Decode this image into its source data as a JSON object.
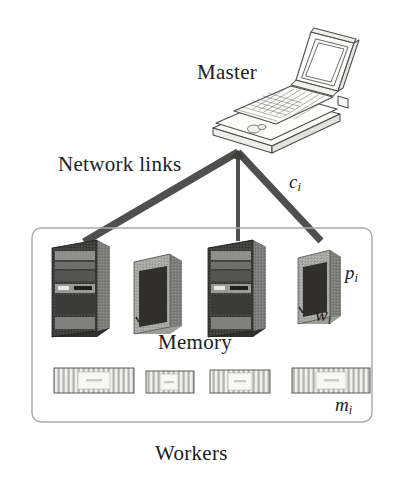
{
  "figure": {
    "width": 404,
    "height": 477,
    "background": "#ffffff"
  },
  "labels": {
    "master": "Master",
    "network_links": "Network links",
    "memory": "Memory",
    "workers": "Workers",
    "link_capacity_symbol": "c",
    "link_capacity_subscript": "i",
    "processor_symbol": "p",
    "processor_subscript": "i",
    "worker_symbol": "w",
    "worker_subscript": "i",
    "memory_symbol": "m",
    "memory_subscript": "i"
  },
  "colors": {
    "ink": "#20201e",
    "line": "#3a3a38",
    "link_dark": "#4a4a48",
    "link_mid": "#585856",
    "box_border": "#a9a9a7",
    "tower_dark": "#3d3d3b",
    "tower_light": "#a6a6a2",
    "tower_mid": "#7d7d79",
    "ram_body": "#cfcfca",
    "ram_label": "#f4f4f2",
    "laptop_fill": "#fbfbfa",
    "laptop_stroke": "#4c4c4a",
    "screen_fill": "#ffffff"
  },
  "master_node": {
    "type": "laptop",
    "name": "Master",
    "position": {
      "x": 238,
      "y": 92
    }
  },
  "network_links": [
    {
      "id": "link-1",
      "from_worker": 1,
      "weight": "thick",
      "stroke_width": 7.5,
      "x1": 238,
      "y1": 152,
      "x2": 84,
      "y2": 242
    },
    {
      "id": "link-2",
      "from_worker": 2,
      "weight": "thin",
      "stroke_width": 3.0,
      "x1": 238,
      "y1": 152,
      "x2": 162,
      "y2": 248
    },
    {
      "id": "link-3",
      "from_worker": 3,
      "weight": "medium",
      "stroke_width": 4.0,
      "x1": 238,
      "y1": 152,
      "x2": 238,
      "y2": 240
    },
    {
      "id": "link-4",
      "from_worker": 4,
      "weight": "thick",
      "stroke_width": 7.0,
      "x1": 238,
      "y1": 152,
      "x2": 320,
      "y2": 240
    }
  ],
  "workers_box": {
    "x": 32,
    "y": 228,
    "width": 340,
    "height": 194,
    "corner_radius": 9,
    "border_color": "#a9a9a7",
    "border_width": 1.4
  },
  "workers": [
    {
      "id": "worker-1",
      "tower_style": "detailed",
      "x": 52,
      "y": 240,
      "width": 58,
      "height": 97,
      "labels": []
    },
    {
      "id": "worker-2",
      "tower_style": "plain",
      "x": 134,
      "y": 254,
      "width": 46,
      "height": 80,
      "labels": []
    },
    {
      "id": "worker-3",
      "tower_style": "detailed",
      "x": 208,
      "y": 240,
      "width": 58,
      "height": 97,
      "labels": []
    },
    {
      "id": "worker-4",
      "tower_style": "plain",
      "x": 298,
      "y": 250,
      "width": 42,
      "height": 74,
      "labels": [
        "p_i",
        "w_i"
      ]
    }
  ],
  "memory_modules": [
    {
      "id": "memory-1",
      "x": 54,
      "y": 368,
      "width": 80,
      "height": 25,
      "chip_count": 14
    },
    {
      "id": "memory-2",
      "x": 146,
      "y": 371,
      "width": 48,
      "height": 22,
      "chip_count": 9
    },
    {
      "id": "memory-3",
      "x": 210,
      "y": 370,
      "width": 60,
      "height": 23,
      "chip_count": 11
    },
    {
      "id": "memory-4",
      "x": 292,
      "y": 368,
      "width": 78,
      "height": 25,
      "chip_count": 14
    }
  ]
}
